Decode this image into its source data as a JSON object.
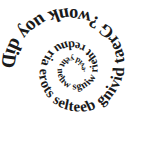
{
  "image": {
    "kind": "spiral-text-graphic",
    "background_color": "#ffffff",
    "text_color": "#1a1a1a",
    "width": 153,
    "height": 141
  },
  "spiral_text": {
    "full_text": "Did you know? Great diving beetles store air under their wings when they dive.",
    "lead_in": "Did you know?",
    "fact": "Great diving beetles store air under their wings when they dive.",
    "words": [
      "Did",
      "you",
      "know?",
      "Great",
      "diving",
      "beetles",
      "store",
      "air",
      "under",
      "their",
      "wings",
      "when",
      "they",
      "dive."
    ],
    "direction": "clockwise-inward",
    "start_angle_deg": 182,
    "center_x": 74,
    "center_y": 70,
    "start_radius": 68,
    "end_radius": 9,
    "start_font_size": 20,
    "end_font_size": 7.5
  }
}
